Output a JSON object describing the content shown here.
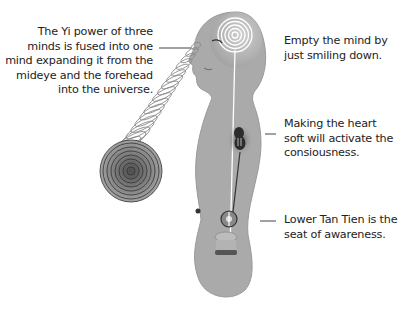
{
  "labels": {
    "yi_power": {
      "lines": [
        "The Yi power of three",
        "minds is fused into one",
        "mind expanding it from the",
        "mideye and the forehead",
        "into the universe."
      ]
    },
    "empty_mind": {
      "lines": [
        "Empty the mind by",
        "just smiling down."
      ]
    },
    "heart": {
      "lines": [
        "Making the heart",
        "soft will activate the",
        "consiousness."
      ]
    },
    "lower_tan_tien": {
      "lines": [
        "Lower Tan Tien is the",
        "seat of awareness."
      ]
    }
  },
  "colors": {
    "body_fill": "#a9a9a9",
    "body_light": "#cfcfcf",
    "spiral_stroke": "#777777",
    "energy_line": "#ffffff",
    "leader_line": "#444444"
  }
}
